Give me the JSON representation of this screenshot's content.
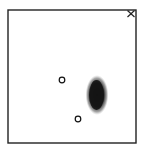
{
  "diagram": {
    "frame": {
      "x": 8,
      "y": 10,
      "width": 128,
      "height": 133,
      "stroke": "#222222"
    },
    "corner_mark": {
      "symbol": "×",
      "x": 131,
      "y": 13,
      "color": "#222222"
    },
    "markers": [
      {
        "shape": "circle",
        "cx": 62,
        "cy": 80,
        "r": 2.8,
        "stroke": "#111111"
      },
      {
        "shape": "circle",
        "cx": 78,
        "cy": 119,
        "r": 2.8,
        "stroke": "#111111"
      }
    ],
    "blob": {
      "cx": 97,
      "cy": 95,
      "rx": 10,
      "ry": 18,
      "color": "#1a1a1a"
    }
  }
}
